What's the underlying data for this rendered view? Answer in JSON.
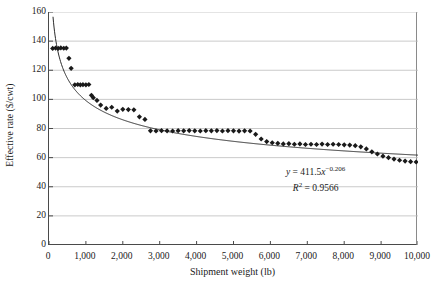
{
  "chart_data": {
    "type": "scatter",
    "title": "",
    "xlabel": "Shipment weight (lb)",
    "ylabel": "Effective rate ($/cwt)",
    "xlim": [
      0,
      10000
    ],
    "ylim": [
      0,
      160
    ],
    "xticks": [
      0,
      1000,
      2000,
      3000,
      4000,
      5000,
      6000,
      7000,
      8000,
      9000,
      10000
    ],
    "xtick_labels": [
      "0",
      "1,000",
      "2,000",
      "3,000",
      "4,000",
      "5,000",
      "6,000",
      "7,000",
      "8,000",
      "9,000",
      "10,000"
    ],
    "yticks": [
      0,
      20,
      40,
      60,
      80,
      100,
      120,
      140,
      160
    ],
    "ytick_labels": [
      "0",
      "20",
      "40",
      "60",
      "80",
      "100",
      "120",
      "140",
      "160"
    ],
    "grid": "horizontal",
    "grid_color": "#bdbdbd",
    "legend": "none",
    "marker": "diamond",
    "marker_color": "#1a1a1a",
    "marker_size": 2.6,
    "trendline": {
      "type": "power",
      "coefficient": 411.5,
      "exponent": -0.206,
      "color": "#2b2b2b",
      "width": 1.0,
      "r_squared": 0.9566
    },
    "annotations": [
      {
        "name": "trendline-equation",
        "text": "y = 411.5x⁻⁰·²⁰⁶"
      },
      {
        "name": "r-squared",
        "text": "R² = 0.9566"
      }
    ],
    "series": [
      {
        "name": "Effective rate observations",
        "points": [
          [
            100,
            135.0
          ],
          [
            180,
            135.2
          ],
          [
            250,
            135.0
          ],
          [
            320,
            135.3
          ],
          [
            400,
            135.1
          ],
          [
            470,
            135.2
          ],
          [
            540,
            128.2
          ],
          [
            600,
            121.3
          ],
          [
            700,
            110.0
          ],
          [
            780,
            110.2
          ],
          [
            850,
            110.0
          ],
          [
            920,
            110.1
          ],
          [
            1000,
            110.0
          ],
          [
            1080,
            110.2
          ],
          [
            1150,
            102.8
          ],
          [
            1200,
            101.2
          ],
          [
            1300,
            99.3
          ],
          [
            1400,
            96.1
          ],
          [
            1550,
            93.8
          ],
          [
            1700,
            94.6
          ],
          [
            1850,
            92.0
          ],
          [
            2000,
            93.2
          ],
          [
            2150,
            93.0
          ],
          [
            2300,
            92.8
          ],
          [
            2450,
            88.0
          ],
          [
            2600,
            86.2
          ],
          [
            2750,
            78.4
          ],
          [
            2900,
            78.3
          ],
          [
            3050,
            78.5
          ],
          [
            3200,
            78.4
          ],
          [
            3350,
            78.3
          ],
          [
            3500,
            78.5
          ],
          [
            3650,
            78.4
          ],
          [
            3800,
            78.6
          ],
          [
            3950,
            78.4
          ],
          [
            4100,
            78.3
          ],
          [
            4250,
            78.5
          ],
          [
            4400,
            78.4
          ],
          [
            4550,
            78.6
          ],
          [
            4700,
            78.3
          ],
          [
            4850,
            78.5
          ],
          [
            5000,
            78.4
          ],
          [
            5150,
            78.2
          ],
          [
            5300,
            78.4
          ],
          [
            5450,
            78.3
          ],
          [
            5600,
            76.0
          ],
          [
            5750,
            72.8
          ],
          [
            5900,
            71.0
          ],
          [
            6050,
            70.2
          ],
          [
            6200,
            69.8
          ],
          [
            6350,
            69.4
          ],
          [
            6500,
            69.6
          ],
          [
            6650,
            69.2
          ],
          [
            6800,
            69.4
          ],
          [
            6950,
            69.0
          ],
          [
            7100,
            69.2
          ],
          [
            7250,
            69.0
          ],
          [
            7400,
            69.3
          ],
          [
            7550,
            69.0
          ],
          [
            7700,
            69.2
          ],
          [
            7850,
            69.0
          ],
          [
            8000,
            68.8
          ],
          [
            8150,
            68.6
          ],
          [
            8300,
            68.2
          ],
          [
            8450,
            67.4
          ],
          [
            8600,
            66.0
          ],
          [
            8750,
            64.0
          ],
          [
            8900,
            62.5
          ],
          [
            9050,
            61.0
          ],
          [
            9200,
            60.0
          ],
          [
            9350,
            59.0
          ],
          [
            9500,
            58.2
          ],
          [
            9650,
            57.6
          ],
          [
            9800,
            57.2
          ],
          [
            9950,
            57.0
          ]
        ]
      }
    ]
  },
  "caption": {
    "partial": ""
  }
}
